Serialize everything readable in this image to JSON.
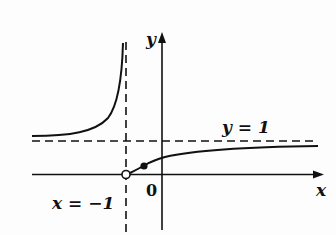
{
  "figure": {
    "type": "function-graph",
    "axes": {
      "x_label": "x",
      "y_label": "y",
      "origin_label": "0"
    },
    "asymptotes": {
      "vertical": {
        "label": "x = −1",
        "x": -1
      },
      "horizontal": {
        "label": "y = 1",
        "y": 1
      }
    },
    "points": [
      {
        "kind": "open",
        "x": -1,
        "y": 0
      },
      {
        "kind": "filled",
        "description": "point on right branch between x = −1 and 0"
      }
    ],
    "branches": [
      {
        "name": "left-branch",
        "description": "for x < −1, above y = 1, rises to +∞ as x → −1⁻"
      },
      {
        "name": "right-branch",
        "description": "for x > −1, from (−1,0) increasing toward y = 1"
      }
    ],
    "colors": {
      "ink": "#111111",
      "background": "#fdfdfd"
    }
  }
}
